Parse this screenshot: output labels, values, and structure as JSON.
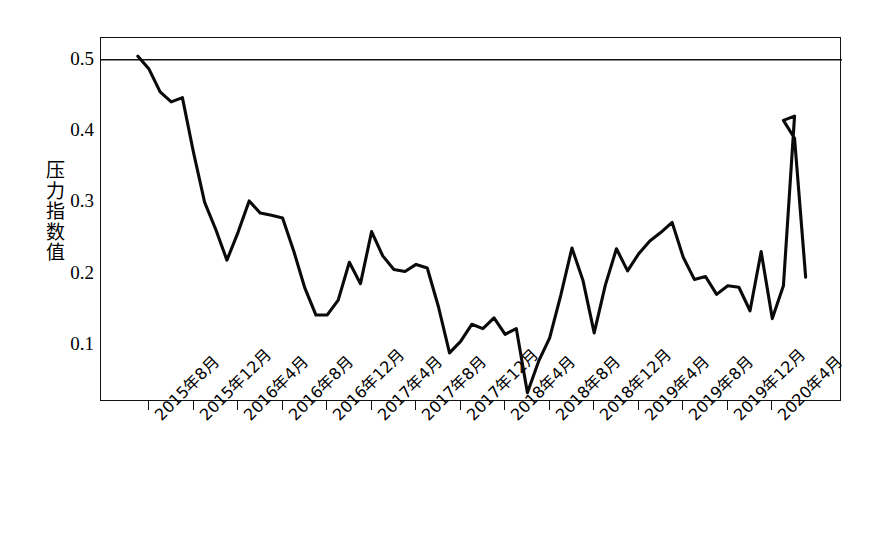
{
  "chart_data": {
    "type": "line",
    "title": "",
    "xlabel": "",
    "ylabel": "压力指数值",
    "ylim": [
      0.0,
      0.53
    ],
    "yticks": [
      0.1,
      0.2,
      0.3,
      0.4,
      0.5
    ],
    "ytick_labels": [
      "0.1",
      "0.2",
      "0.3",
      "0.4",
      "0.5"
    ],
    "grid": false,
    "legend": "none",
    "reference_line": {
      "y": 0.5,
      "style": "solid",
      "color": "#111111"
    },
    "line_color": "#0a0a0a",
    "x_tick_labels": [
      "2015年8月",
      "2015年12月",
      "2016年4月",
      "2016年8月",
      "2016年12月",
      "2017年4月",
      "2017年8月",
      "2017年12月",
      "2018年4月",
      "2018年8月",
      "2018年12月",
      "2019年4月",
      "2019年8月",
      "2019年12月",
      "2020年4月"
    ],
    "x_tick_months": [
      "2015-08",
      "2015-12",
      "2016-04",
      "2016-08",
      "2016-12",
      "2017-04",
      "2017-08",
      "2017-12",
      "2018-04",
      "2018-08",
      "2018-12",
      "2019-04",
      "2019-08",
      "2019-12",
      "2020-04"
    ],
    "x": [
      "2015-07",
      "2015-08",
      "2015-09",
      "2015-10",
      "2015-11",
      "2015-12",
      "2016-01",
      "2016-02",
      "2016-03",
      "2016-04",
      "2016-05",
      "2016-06",
      "2016-07",
      "2016-08",
      "2016-09",
      "2016-10",
      "2016-11",
      "2016-12",
      "2017-01",
      "2017-02",
      "2017-03",
      "2017-04",
      "2017-05",
      "2017-06",
      "2017-07",
      "2017-08",
      "2017-09",
      "2017-10",
      "2017-11",
      "2017-12",
      "2018-01",
      "2018-02",
      "2018-03",
      "2018-04",
      "2018-05",
      "2018-06",
      "2018-07",
      "2018-08",
      "2018-09",
      "2018-10",
      "2018-11",
      "2018-12",
      "2019-01",
      "2019-02",
      "2019-03",
      "2019-04",
      "2019-05",
      "2019-06",
      "2019-07",
      "2019-08",
      "2019-09",
      "2019-10",
      "2019-11",
      "2019-12",
      "2020-01",
      "2020-02",
      "2020-03",
      "2020-04",
      "2020-05",
      "2020-06"
    ],
    "values": [
      0.505,
      0.487,
      0.455,
      0.441,
      0.447,
      0.37,
      0.3,
      0.262,
      0.219,
      0.258,
      0.302,
      0.285,
      0.282,
      0.278,
      0.232,
      0.18,
      0.142,
      0.142,
      0.163,
      0.216,
      0.186,
      0.259,
      0.225,
      0.206,
      0.203,
      0.213,
      0.208,
      0.154,
      0.089,
      0.105,
      0.129,
      0.123,
      0.138,
      0.115,
      0.123,
      0.033,
      0.077,
      0.11,
      0.17,
      0.236,
      0.19,
      0.117,
      0.184,
      0.235,
      0.204,
      0.228,
      0.246,
      0.258,
      0.272,
      0.223,
      0.192,
      0.196,
      0.171,
      0.183,
      0.181,
      0.148,
      0.231,
      0.137,
      0.183,
      0.421
    ],
    "series_values_note": "",
    "series": [
      {
        "name": "压力指数值",
        "values": [
          0.505,
          0.487,
          0.455,
          0.441,
          0.447,
          0.37,
          0.3,
          0.262,
          0.219,
          0.258,
          0.302,
          0.285,
          0.282,
          0.278,
          0.232,
          0.18,
          0.142,
          0.142,
          0.163,
          0.216,
          0.186,
          0.259,
          0.225,
          0.206,
          0.203,
          0.213,
          0.208,
          0.154,
          0.089,
          0.105,
          0.129,
          0.123,
          0.138,
          0.115,
          0.123,
          0.033,
          0.077,
          0.11,
          0.17,
          0.236,
          0.19,
          0.117,
          0.184,
          0.235,
          0.204,
          0.228,
          0.246,
          0.258,
          0.272,
          0.223,
          0.192,
          0.196,
          0.171,
          0.183,
          0.181,
          0.148,
          0.231,
          0.137,
          0.183,
          0.421
        ]
      }
    ],
    "tail_x": [
      "2020-05",
      "2020-06",
      "2020-07"
    ],
    "tail_values": [
      0.415,
      0.39,
      0.195
    ]
  },
  "axis": {
    "y_title_chars": [
      "压",
      "力",
      "指",
      "数",
      "值"
    ]
  }
}
